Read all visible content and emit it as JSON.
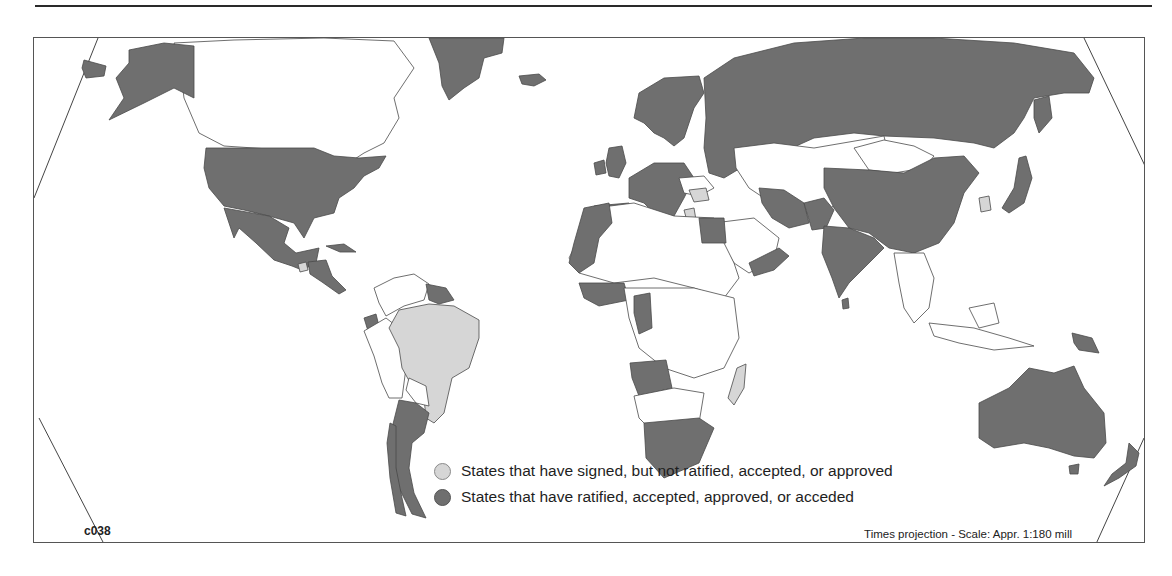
{
  "map": {
    "code": "c038",
    "projection_note": "Times projection - Scale: Appr. 1:180 mill",
    "colors": {
      "ratified": "#6f6f6f",
      "signed": "#d6d6d6",
      "none": "#ffffff",
      "border": "#4a4a4a"
    },
    "legend": {
      "items": [
        {
          "key": "signed",
          "label": "States that have signed, but not ratified, accepted, or approved"
        },
        {
          "key": "ratified",
          "label": "States that have ratified, accepted, approved, or acceded"
        }
      ]
    },
    "regions": {
      "ratified": [
        "United States",
        "Alaska",
        "Mexico",
        "Greenland",
        "Iceland",
        "Russia",
        "Norway",
        "Sweden",
        "Finland",
        "United Kingdom",
        "Ireland",
        "France",
        "Spain",
        "Portugal",
        "Germany",
        "Italy",
        "Poland",
        "Ukraine",
        "China",
        "India",
        "Pakistan",
        "Iran",
        "Japan",
        "Australia",
        "New Zealand",
        "Argentina",
        "Chile",
        "Angola",
        "South Africa",
        "Egypt",
        "Morocco",
        "Mauritania",
        "Cameroon",
        "Gabon",
        "Papua New Guinea",
        "Suriname",
        "Guyana",
        "Ecuador",
        "Yemen",
        "Cuba",
        "Sri Lanka"
      ],
      "signed": [
        "Brazil",
        "Madagascar",
        "Romania",
        "Greece",
        "South Korea",
        "Guatemala"
      ]
    }
  }
}
